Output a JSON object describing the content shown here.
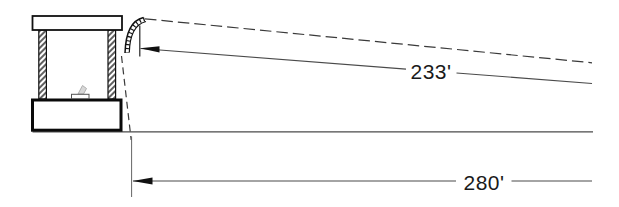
{
  "drawing": {
    "type": "engineering-elevation-diagram",
    "upper_dimension_label": "233'",
    "lower_dimension_label": "280'",
    "colors": {
      "background": "#ffffff",
      "structure_line": "#111111",
      "dimension_line": "#4a4a4a",
      "marker_figure": "#a8a8a8",
      "text": "#1a1a1a"
    }
  }
}
